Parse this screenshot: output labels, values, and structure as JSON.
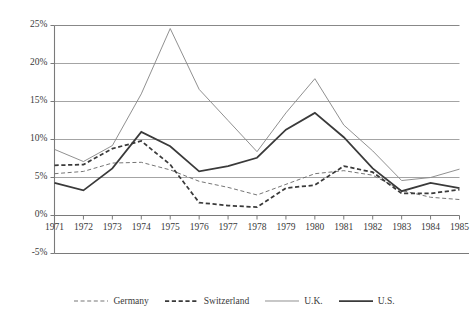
{
  "chart_data": {
    "type": "line",
    "title": "",
    "subtitle": "",
    "xlabel": "",
    "ylabel": "",
    "grid": true,
    "legend_position": "bottom",
    "x": [
      1971,
      1972,
      1973,
      1974,
      1975,
      1976,
      1977,
      1978,
      1979,
      1980,
      1981,
      1982,
      1983,
      1984,
      1985
    ],
    "xtick_labels": [
      "1971",
      "1972",
      "1973",
      "1974",
      "1975",
      "1976",
      "1977",
      "1978",
      "1979",
      "1980",
      "1981",
      "1982",
      "1983",
      "1984",
      "1985"
    ],
    "ytick_labels": [
      "25%",
      "20%",
      "15%",
      "10%",
      "5%",
      "0%",
      "-5%"
    ],
    "ytick_values": [
      25,
      20,
      15,
      10,
      5,
      0,
      -5
    ],
    "ylim": [
      -5,
      25
    ],
    "xlim": [
      1971,
      1985
    ],
    "series": [
      {
        "name": "Germany",
        "style": "dashed-thin",
        "color": "#6e6e6e",
        "values": [
          5.5,
          5.8,
          6.9,
          7.0,
          6.0,
          4.5,
          3.7,
          2.7,
          4.1,
          5.5,
          5.9,
          5.3,
          3.3,
          2.4,
          2.1
        ]
      },
      {
        "name": "Switzerland",
        "style": "dashed-thick",
        "color": "#3a3a3a",
        "values": [
          6.6,
          6.7,
          8.8,
          9.8,
          6.7,
          1.7,
          1.3,
          1.1,
          3.6,
          4.0,
          6.5,
          5.7,
          2.9,
          2.9,
          3.4
        ]
      },
      {
        "name": "U.K.",
        "style": "solid-thin",
        "color": "#8a8a8a",
        "values": [
          8.7,
          7.1,
          9.2,
          16.0,
          24.6,
          16.6,
          12.5,
          8.4,
          13.5,
          18.0,
          11.9,
          8.5,
          4.6,
          5.0,
          6.1
        ]
      },
      {
        "name": "U.S.",
        "style": "solid-thick",
        "color": "#3a3a3a",
        "values": [
          4.3,
          3.3,
          6.2,
          11.0,
          9.1,
          5.8,
          6.5,
          7.6,
          11.3,
          13.5,
          10.3,
          6.2,
          3.2,
          4.3,
          3.6
        ]
      }
    ]
  }
}
